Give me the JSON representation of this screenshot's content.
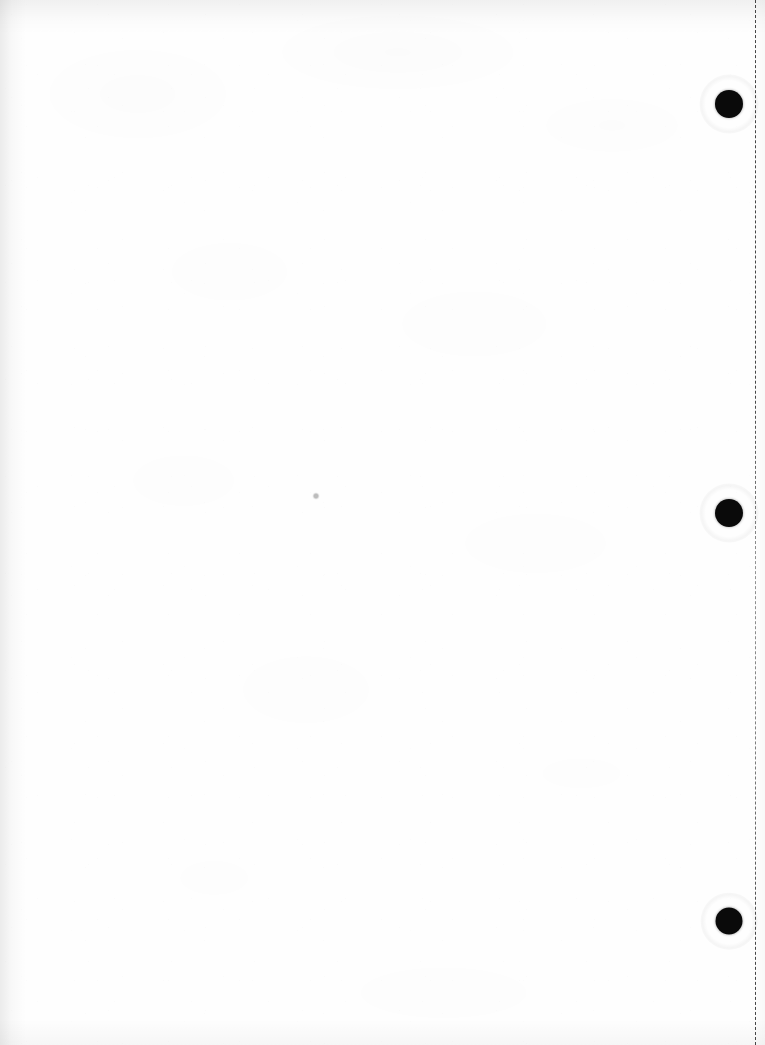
{
  "document": {
    "kind": "scanned-blank-page",
    "description": "Blank scanned sheet of white paper with three punch holes and a vertical perforation line",
    "page_label": "",
    "visible_text": "",
    "width": 765,
    "height": 1045,
    "paper_color": "#fefefe",
    "ink_color": "#0a0a0a"
  },
  "punch_holes": {
    "count": 3,
    "diameter": 28,
    "color": "#0a0a0a",
    "items": [
      {
        "name": "punch-hole-top",
        "cx": 729,
        "cy": 104,
        "d": 28
      },
      {
        "name": "punch-hole-middle",
        "cx": 729,
        "cy": 513,
        "d": 28
      },
      {
        "name": "punch-hole-bottom",
        "cx": 729,
        "cy": 921,
        "d": 27
      }
    ]
  },
  "perforation": {
    "name": "perforation-tear-line",
    "orientation": "vertical",
    "x": 755,
    "dash_length": 8,
    "gap_length": 5,
    "color": "#464646"
  },
  "marks": [
    {
      "name": "dust-speck",
      "cx": 316,
      "cy": 496,
      "d": 7
    }
  ],
  "scan_artifacts": {
    "left_edge_shadow": true,
    "top_edge_shadow": true,
    "bottom_edge_shadow": true,
    "right_edge_shadow": true,
    "paper_grain": true
  }
}
